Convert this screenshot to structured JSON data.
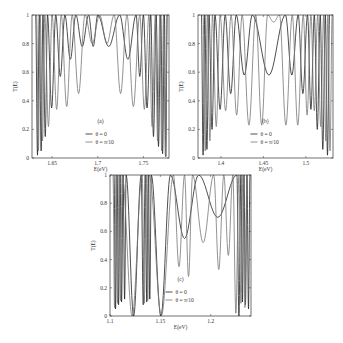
{
  "chart_data": [
    {
      "type": "line",
      "panel_label": "(a)",
      "xlabel": "E(eV)",
      "ylabel": "T(E)",
      "xlim": [
        1.628,
        1.778
      ],
      "ylim": [
        0,
        1
      ],
      "xticks": [
        "1.65",
        "1.7",
        "1.75"
      ],
      "xtick_values": [
        1.65,
        1.7,
        1.75
      ],
      "yticks": [
        "0",
        "0.2",
        "0.4",
        "0.6",
        "0.8",
        "1"
      ],
      "legend": [
        "θ = 0",
        "θ = π/10"
      ],
      "legend_position": "lower center",
      "series": [
        {
          "name": "θ = 0",
          "color": "#222222",
          "peaks": [
            1.632,
            1.636,
            1.64,
            1.645,
            1.654,
            1.664,
            1.676,
            1.69,
            1.7,
            1.724,
            1.742,
            1.75,
            1.758,
            1.764,
            1.769,
            1.773,
            1.776
          ],
          "minima": [
            0.02,
            0.05,
            0.15,
            0.35,
            0.57,
            0.69,
            0.78,
            0.78,
            0.78,
            0.69,
            0.57,
            0.35,
            0.15,
            0.08,
            0.03,
            0.01
          ]
        },
        {
          "name": "θ = π/10",
          "color": "#777777",
          "peaks": [
            1.633,
            1.637,
            1.642,
            1.65,
            1.66,
            1.672,
            1.686,
            1.702,
            1.718,
            1.732,
            1.746,
            1.756,
            1.763,
            1.768,
            1.772,
            1.776
          ],
          "minima": [
            0.05,
            0.12,
            0.22,
            0.34,
            0.36,
            0.45,
            0.8,
            0.8,
            0.45,
            0.36,
            0.34,
            0.22,
            0.12,
            0.05,
            0.02
          ]
        }
      ]
    },
    {
      "type": "line",
      "panel_label": "(b)",
      "xlabel": "E(eV)",
      "ylabel": "T(E)",
      "xlim": [
        1.373,
        1.532
      ],
      "ylim": [
        0,
        1
      ],
      "xticks": [
        "1.4",
        "1.45",
        "1.5"
      ],
      "xtick_values": [
        1.4,
        1.45,
        1.5
      ],
      "yticks": [
        "0",
        "0.2",
        "0.4",
        "0.6",
        "0.8",
        "1"
      ],
      "legend": [
        "θ = 0",
        "θ = π/10"
      ],
      "legend_position": "lower center",
      "series": [
        {
          "name": "θ = 0",
          "color": "#222222",
          "peaks": [
            1.377,
            1.381,
            1.386,
            1.393,
            1.405,
            1.418,
            1.437,
            1.476,
            1.491,
            1.502,
            1.51,
            1.517,
            1.523,
            1.528
          ],
          "minima": [
            0.02,
            0.06,
            0.2,
            0.34,
            0.45,
            0.58,
            0.58,
            0.58,
            0.45,
            0.34,
            0.2,
            0.06,
            0.02
          ]
        },
        {
          "name": "θ = π/10",
          "color": "#777777",
          "peaks": [
            1.379,
            1.384,
            1.39,
            1.399,
            1.412,
            1.425,
            1.441,
            1.455,
            1.469,
            1.484,
            1.497,
            1.506,
            1.514,
            1.521,
            1.526,
            1.531
          ],
          "minima": [
            0.05,
            0.12,
            0.22,
            0.33,
            0.3,
            0.23,
            0.23,
            0.95,
            0.23,
            0.23,
            0.3,
            0.33,
            0.22,
            0.12,
            0.05
          ]
        }
      ]
    },
    {
      "type": "line",
      "panel_label": "(c)",
      "xlabel": "E(eV)",
      "ylabel": "T(E)",
      "xlim": [
        1.1,
        1.24
      ],
      "ylim": [
        0,
        1
      ],
      "xticks": [
        "1.1",
        "1.15",
        "1.2",
        "1.25"
      ],
      "xtick_values": [
        1.1,
        1.15,
        1.2,
        1.25
      ],
      "yticks": [
        "0",
        "0.2",
        "0.4",
        "0.6",
        "0.8",
        "1"
      ],
      "legend": [
        "θ = 0",
        "θ = π/10"
      ],
      "legend_position": "lower center",
      "series": [
        {
          "name": "θ = 0",
          "color": "#222222",
          "peaks": [
            1.104,
            1.107,
            1.11,
            1.113,
            1.116,
            1.131,
            1.135,
            1.138,
            1.141,
            1.16,
            1.188,
            1.226,
            1.23,
            1.233,
            1.236,
            1.239
          ],
          "minima": [
            0.05,
            0.08,
            0.1,
            0.12,
            0.0,
            0.08,
            0.1,
            0.12,
            0.0,
            0.55,
            0.7,
            0.0,
            0.1,
            0.08,
            0.05
          ]
        },
        {
          "name": "θ = π/10",
          "color": "#777777",
          "peaks": [
            1.103,
            1.106,
            1.109,
            1.112,
            1.132,
            1.136,
            1.139,
            1.163,
            1.174,
            1.182,
            1.203,
            1.213,
            1.222,
            1.228,
            1.232,
            1.236
          ],
          "minima": [
            0.06,
            0.09,
            0.11,
            0.0,
            0.09,
            0.11,
            0.0,
            0.35,
            0.28,
            0.52,
            0.33,
            0.43,
            0.02,
            0.09,
            0.06
          ]
        }
      ]
    }
  ]
}
